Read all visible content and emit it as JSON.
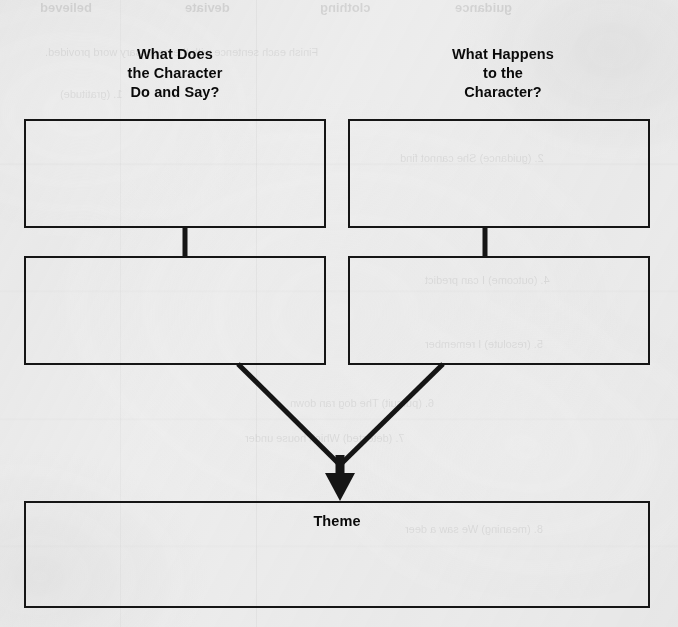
{
  "page": {
    "width": 678,
    "height": 627,
    "background_color": "#efefef",
    "ink_color": "#151515",
    "document_type": "worksheet-graphic-organizer"
  },
  "diagram": {
    "type": "flowchart",
    "headings": [
      {
        "id": "do-and-say",
        "lines": [
          "What Does",
          "the Character",
          "Do and Say?"
        ],
        "full_text": "What Does the Character Do and Say?"
      },
      {
        "id": "happens-to",
        "lines": [
          "What Happens",
          "to the",
          "Character?"
        ],
        "full_text": "What Happens to the Character?"
      }
    ],
    "boxes": [
      {
        "id": "do-say-1",
        "label": "",
        "column": "left",
        "row": 1
      },
      {
        "id": "happens-1",
        "label": "",
        "column": "right",
        "row": 1
      },
      {
        "id": "do-say-2",
        "label": "",
        "column": "left",
        "row": 2
      },
      {
        "id": "happens-2",
        "label": "",
        "column": "right",
        "row": 2
      },
      {
        "id": "theme",
        "label": "Theme",
        "column": "full",
        "row": 3
      }
    ],
    "theme_label": "Theme",
    "connectors": [
      {
        "from": "do-say-1",
        "to": "do-say-2",
        "style": "vertical-line"
      },
      {
        "from": "happens-1",
        "to": "happens-2",
        "style": "vertical-line"
      },
      {
        "from": "do-say-2",
        "to": "theme",
        "style": "diagonal-arrow"
      },
      {
        "from": "happens-2",
        "to": "theme",
        "style": "diagonal-arrow"
      }
    ]
  },
  "ghost_text": {
    "note": "Faint mirrored show-through text from the reverse side of the scanned page.",
    "items": [
      {
        "text": "believed",
        "x": 40,
        "y": 0,
        "size": 13
      },
      {
        "text": "deviate",
        "x": 185,
        "y": 0,
        "size": 13
      },
      {
        "text": "clothing",
        "x": 320,
        "y": 0,
        "size": 13
      },
      {
        "text": "guidance",
        "x": 455,
        "y": 0,
        "size": 13
      },
      {
        "text": "Finish each sentence with the necessary word provided.",
        "x": 45,
        "y": 46,
        "size": 11
      },
      {
        "text": "1. (gratitude)",
        "x": 60,
        "y": 88,
        "size": 11
      },
      {
        "text": "2. (guidance) She cannot find",
        "x": 400,
        "y": 152,
        "size": 11
      },
      {
        "text": "4. (outcome) I can predict",
        "x": 425,
        "y": 274,
        "size": 11
      },
      {
        "text": "5. (resolute) I remember",
        "x": 425,
        "y": 338,
        "size": 11
      },
      {
        "text": "6. (pursuit) The dog ran down",
        "x": 290,
        "y": 397,
        "size": 11
      },
      {
        "text": "7. (detested) Which house under",
        "x": 245,
        "y": 432,
        "size": 11
      },
      {
        "text": "8. (meaning) We saw a deer",
        "x": 405,
        "y": 523,
        "size": 11
      }
    ]
  }
}
